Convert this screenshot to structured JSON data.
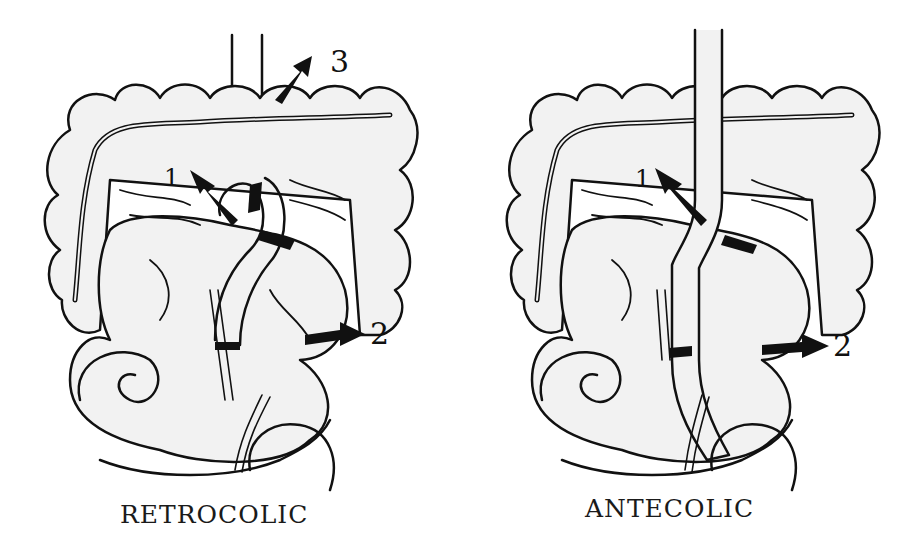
{
  "diagram": {
    "colors": {
      "outline": "#111111",
      "fill": "#f2f2f2",
      "arrow": "#111111",
      "background": "#ffffff"
    },
    "panels": [
      {
        "id": "retrocolic",
        "caption": "RETROCOLIC",
        "arrows": [
          {
            "label": "1",
            "direction": "up-left"
          },
          {
            "label": "2",
            "direction": "right"
          },
          {
            "label": "3",
            "direction": "up-right"
          }
        ]
      },
      {
        "id": "antecolic",
        "caption": "ANTECOLIC",
        "arrows": [
          {
            "label": "1",
            "direction": "up-left"
          },
          {
            "label": "2",
            "direction": "right"
          }
        ]
      }
    ]
  }
}
